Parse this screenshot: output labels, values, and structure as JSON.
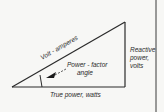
{
  "diagram": {
    "labels": {
      "hypotenuse": "Volt - amperes",
      "angle_line1": "Power - factor",
      "angle_line2": "angle",
      "base": "True power, watts",
      "side_line1": "Reactive",
      "side_line2": "power,",
      "side_line3": "volts"
    },
    "colors": {
      "line": "#2a2a2a",
      "background": "#f7f7f5"
    }
  }
}
